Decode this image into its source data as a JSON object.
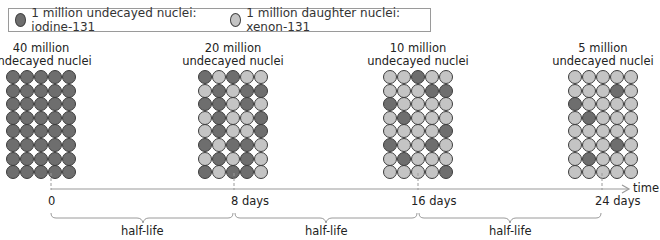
{
  "legend": {
    "items": [
      {
        "label": "1 million undecayed nuclei: iodine-131",
        "color": "#6e6e6e"
      },
      {
        "label": "1 million daughter nuclei: xenon-131",
        "color": "#c4c4c4"
      }
    ]
  },
  "colors": {
    "undecayed": "#6e6e6e",
    "daughter": "#c4c4c4",
    "axis": "#9a9a9a"
  },
  "stages": [
    {
      "label_line1": "40 million",
      "label_line2": "undecayed nuclei",
      "time_label": "0",
      "grid": [
        "DDDDD",
        "DDDDD",
        "DDDDD",
        "DDDDD",
        "DDDDD",
        "DDDDD",
        "DDDDD",
        "DDDDD"
      ]
    },
    {
      "label_line1": "20 million",
      "label_line2": "undecayed nuclei",
      "time_label": "8 days",
      "grid": [
        "DLDLL",
        "LDLDD",
        "DDLDL",
        "LDLLD",
        "LDLLD",
        "DLDDL",
        "LDLDL",
        "DLDDL"
      ]
    },
    {
      "label_line1": "10 million",
      "label_line2": "undecayed nuclei",
      "time_label": "16 days",
      "grid": [
        "LLDLL",
        "LLLDD",
        "DLLLL",
        "LDLLL",
        "LLLLD",
        "DLLDL",
        "LDLLL",
        "LLLLD"
      ]
    },
    {
      "label_line1": "5 million",
      "label_line2": "undecayed nuclei",
      "time_label": "24 days",
      "grid": [
        "LLLLL",
        "LLLDL",
        "DLLLL",
        "LDLLL",
        "LLLLL",
        "LLLDL",
        "LDLLL",
        "LLLLL"
      ]
    }
  ],
  "axis": {
    "label": "time"
  },
  "intervals": [
    {
      "label": "half-life"
    },
    {
      "label": "half-life"
    },
    {
      "label": "half-life"
    }
  ]
}
